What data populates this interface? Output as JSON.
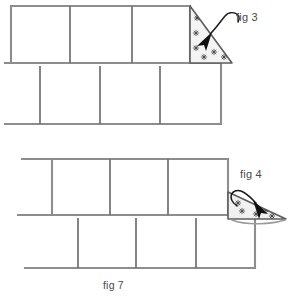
{
  "figure": {
    "caption": "fig 7",
    "background_color": "#ffffff",
    "line_color": "#8a8a8a",
    "dark_line_color": "#5a5a5a",
    "ink_color": "#222222",
    "patterned_fill": "#efefef"
  },
  "labels": {
    "fig3": "fig 3",
    "fig4": "fig 4",
    "fig7": "fig 7"
  },
  "diagrams": [
    {
      "name": "upper-assembly",
      "rows": [
        {
          "name": "upper-row",
          "x1": 11,
          "x2": 190,
          "y_top": 6,
          "y_bottom": 63,
          "dividers": [
            70,
            132
          ],
          "cells": 3
        },
        {
          "name": "lower-row",
          "x1": 5,
          "x2": 221,
          "y_top": 63,
          "y_bottom": 124,
          "dividers": [
            40,
            100,
            160
          ],
          "cells": 3
        }
      ],
      "flap": {
        "name": "triangle-flap-fig3",
        "shape": "right-triangle",
        "points": "190,6 190,63 232,63",
        "orientation": "vertical-left-edge-upright",
        "motif": "star-print",
        "motif_count": 9
      },
      "arrow": {
        "name": "fold-arrow-fig3",
        "style": "curved-hook",
        "direction": "down-left"
      }
    },
    {
      "name": "lower-assembly",
      "rows": [
        {
          "name": "upper-row",
          "x1": 22,
          "x2": 228,
          "y_top": 159,
          "y_bottom": 215,
          "dividers": [
            52,
            110,
            168
          ],
          "cells": 3
        },
        {
          "name": "lower-row",
          "x1": 25,
          "x2": 255,
          "y_top": 215,
          "y_bottom": 268,
          "dividers": [
            78,
            136,
            196
          ],
          "cells": 3
        }
      ],
      "flap": {
        "name": "triangle-flap-fig4",
        "shape": "flattened-triangle",
        "points": "228,192 286,219 228,219",
        "orientation": "folded-down-flat",
        "motif": "star-print",
        "motif_count": 5
      },
      "arrow": {
        "name": "fold-arrow-fig4",
        "style": "curved-hook",
        "direction": "down-right"
      }
    }
  ]
}
